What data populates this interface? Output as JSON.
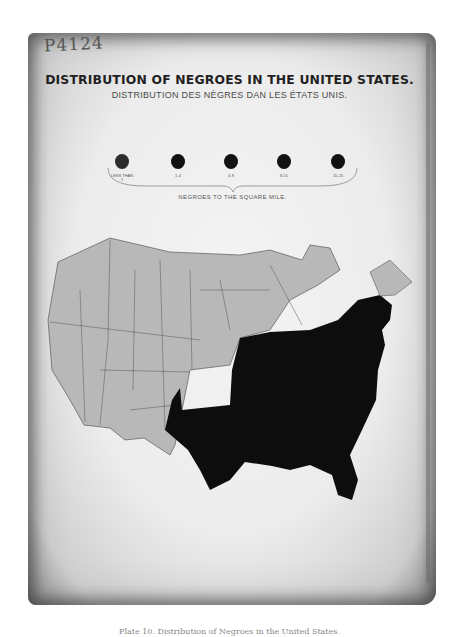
{
  "document": {
    "manuscript_note": "P4124",
    "title": "DISTRIBUTION OF NEGROES IN THE UNITED STATES.",
    "subtitle": "DISTRIBUTION DES NÈGRES DAN LES ÉTATS UNIS.",
    "legend": {
      "caption": "NEGROES TO THE SQUARE MILE.",
      "items": [
        {
          "label_line1": "LESS THAN",
          "label_line2": "1",
          "color": "#2c2c2c"
        },
        {
          "label_line1": "1-4",
          "label_line2": "",
          "color": "#121212"
        },
        {
          "label_line1": "4-8",
          "label_line2": "",
          "color": "#121212"
        },
        {
          "label_line1": "8-15",
          "label_line2": "",
          "color": "#121212"
        },
        {
          "label_line1": "15-25",
          "label_line2": "",
          "color": "#121212"
        }
      ]
    },
    "map": {
      "shaded_region": "Southern and Eastern states (dark)",
      "unshaded_region": "Western and Northern states (light gray)",
      "dark_color": "#0d0d0d",
      "light_color": "#b8b8b8"
    },
    "caption": "Plate 10. Distribution of Negroes in the United States."
  }
}
